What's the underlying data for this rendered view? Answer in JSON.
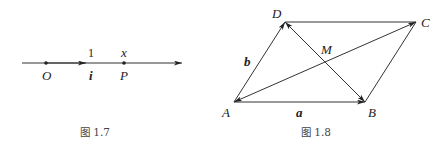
{
  "figure_1_7": {
    "caption": "图 1.7",
    "labels": {
      "origin": "O",
      "unit_value": "1",
      "unit_vector": "i",
      "point_value": "x",
      "point": "P"
    }
  },
  "figure_1_8": {
    "caption": "图 1.8",
    "labels": {
      "A": "A",
      "B": "B",
      "C": "C",
      "D": "D",
      "M": "M",
      "vector_a": "a",
      "vector_b": "b"
    }
  }
}
